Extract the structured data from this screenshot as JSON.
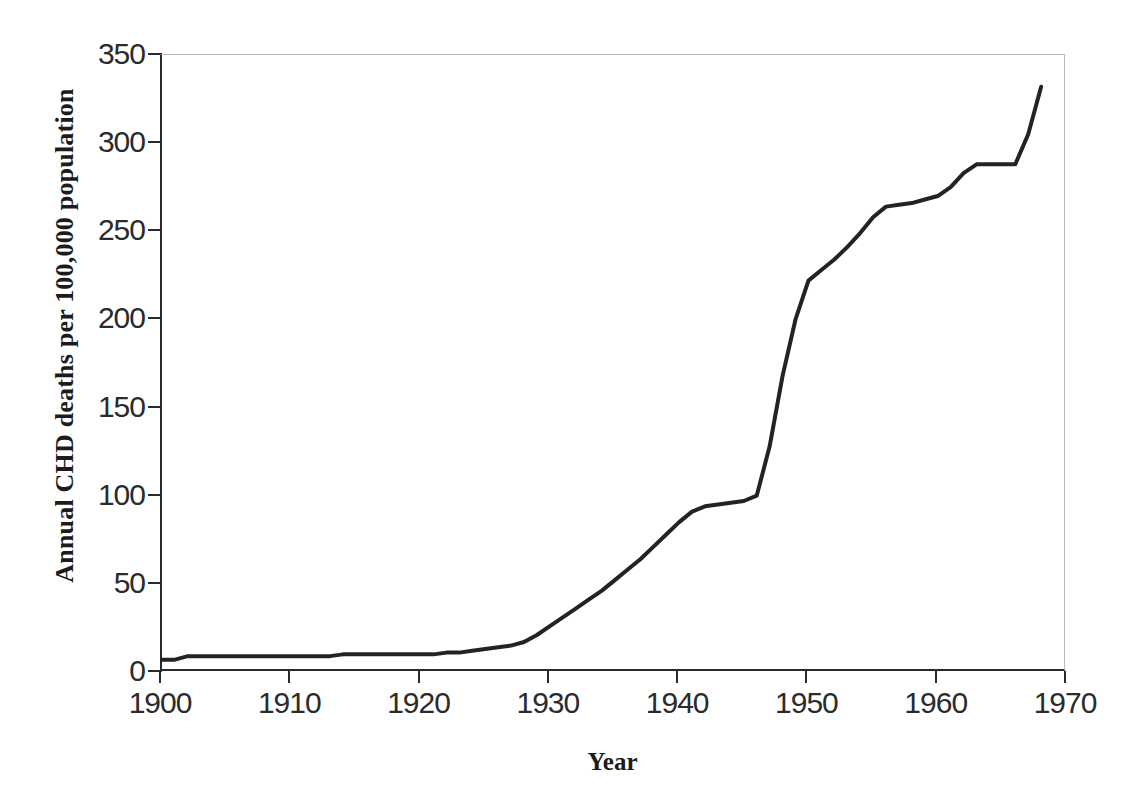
{
  "chart_data": {
    "type": "line",
    "title": "",
    "xlabel": "Year",
    "ylabel": "Annual CHD deaths per 100,000 population",
    "xlim": [
      1900,
      1970
    ],
    "ylim": [
      0,
      350
    ],
    "xticks": [
      1900,
      1910,
      1920,
      1930,
      1940,
      1950,
      1960,
      1970
    ],
    "xtick_labels": [
      "1900",
      "1910",
      "1920",
      "1930",
      "1940",
      "1950",
      "1960",
      "1970"
    ],
    "yticks": [
      0,
      50,
      100,
      150,
      200,
      250,
      300,
      350
    ],
    "ytick_labels": [
      "0",
      "50",
      "100",
      "150",
      "200",
      "250",
      "300",
      "350"
    ],
    "grid": false,
    "legend": false,
    "line_color": "#232323",
    "line_width": 4,
    "series": [
      {
        "name": "Annual CHD deaths per 100,000 population",
        "x": [
          1900,
          1901,
          1902,
          1903,
          1904,
          1905,
          1906,
          1907,
          1908,
          1909,
          1910,
          1911,
          1912,
          1913,
          1914,
          1915,
          1916,
          1917,
          1918,
          1919,
          1920,
          1921,
          1922,
          1923,
          1924,
          1925,
          1926,
          1927,
          1928,
          1929,
          1930,
          1931,
          1932,
          1933,
          1934,
          1935,
          1936,
          1937,
          1938,
          1939,
          1940,
          1941,
          1942,
          1943,
          1944,
          1945,
          1946,
          1947,
          1948,
          1949,
          1950,
          1951,
          1952,
          1953,
          1954,
          1955,
          1956,
          1957,
          1958,
          1959,
          1960,
          1961,
          1962,
          1963,
          1964,
          1965,
          1966,
          1967,
          1968
        ],
        "values": [
          7,
          7,
          9,
          9,
          9,
          9,
          9,
          9,
          9,
          9,
          9,
          9,
          9,
          9,
          10,
          10,
          10,
          10,
          10,
          10,
          10,
          10,
          11,
          11,
          12,
          13,
          14,
          15,
          17,
          21,
          26,
          31,
          36,
          41,
          46,
          52,
          58,
          64,
          71,
          78,
          85,
          91,
          94,
          95,
          96,
          97,
          100,
          128,
          168,
          200,
          222,
          228,
          234,
          241,
          249,
          258,
          264,
          265,
          266,
          268,
          270,
          275,
          283,
          288,
          288,
          288,
          288,
          305,
          332
        ]
      }
    ]
  },
  "axes": {
    "y_title": "Annual CHD deaths per 100,000 population",
    "x_title": "Year"
  }
}
